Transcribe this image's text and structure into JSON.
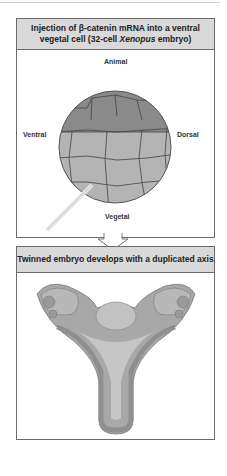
{
  "panel1": {
    "title_line1": "Injection of β-catenin mRNA into a ventral",
    "title_line2_pre": "vegetal cell (32-cell ",
    "title_line2_italic": "Xenopus",
    "title_line2_post": " embryo)",
    "labels": {
      "animal": "Animal",
      "ventral": "Ventral",
      "dorsal": "Dorsal",
      "vegetal": "Vegetal"
    }
  },
  "panel2": {
    "title": "Twinned embryo develops with a duplicated axis"
  },
  "colors": {
    "header_bg": "#d9d9d9",
    "animal_cells": "#8a8a8a",
    "vegetal_cells": "#b4b4b4",
    "border": "#6a6a6a"
  }
}
